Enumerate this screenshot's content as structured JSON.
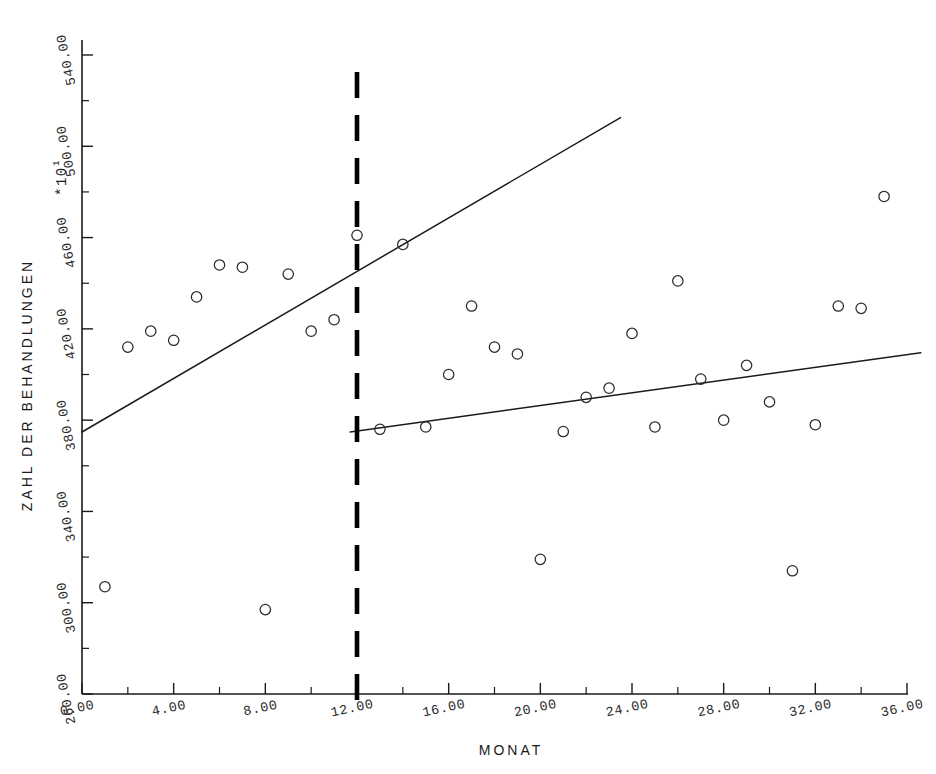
{
  "chart_data": {
    "type": "scatter",
    "title": "",
    "xlabel": "MONAT",
    "ylabel": "ZAHL DER BEHANDLUNGEN",
    "y_exponent_label": "*10",
    "y_exponent_sup": "1",
    "xlim": [
      0,
      36
    ],
    "ylim": [
      260,
      540
    ],
    "grid": false,
    "legend": "none",
    "x_ticks_labeled": [
      "0.00",
      "4.00",
      "8.00",
      "12.00",
      "16.00",
      "20.00",
      "24.00",
      "28.00",
      "32.00",
      "36.00"
    ],
    "x_tick_values": [
      0,
      4,
      8,
      12,
      16,
      20,
      24,
      28,
      32,
      36
    ],
    "x_minor_tick_values": [
      2,
      6,
      10,
      14,
      18,
      22,
      26,
      30,
      34
    ],
    "y_ticks_labeled": [
      "260.00",
      "300.00",
      "340.00",
      "380.00",
      "420.00",
      "460.00",
      "500.00",
      "540.00"
    ],
    "y_tick_values": [
      260,
      300,
      340,
      380,
      420,
      460,
      500,
      540
    ],
    "y_minor_tick_values": [
      280,
      320,
      360,
      400,
      440,
      480,
      520
    ],
    "marker": "open-circle",
    "series": [
      {
        "name": "Beobachtungen",
        "x": [
          1,
          2,
          3,
          4,
          5,
          6,
          7,
          8,
          9,
          10,
          11,
          12,
          13,
          14,
          15,
          16,
          17,
          18,
          19,
          20,
          21,
          22,
          23,
          24,
          25,
          26,
          27,
          28,
          29,
          30,
          31,
          32,
          33,
          34,
          35
        ],
        "y": [
          307,
          412,
          419,
          415,
          434,
          448,
          447,
          297,
          444,
          419,
          424,
          461,
          376,
          457,
          377,
          400,
          430,
          412,
          409,
          319,
          375,
          390,
          394,
          418,
          377,
          441,
          398,
          380,
          404,
          388,
          314,
          378,
          430,
          429,
          478
        ]
      }
    ],
    "annotations": [
      {
        "name": "intervention-line",
        "kind": "vertical-dashed-line",
        "x": 12,
        "style": "thick black dashed"
      },
      {
        "name": "pre-regression-line",
        "kind": "line-segment",
        "x0": 0,
        "y0": 374.8,
        "x1": 23.5,
        "y1": 512.6
      },
      {
        "name": "post-regression-line",
        "kind": "line-segment",
        "x0": 11.7,
        "y0": 374.8,
        "x1": 36.6,
        "y1": 409.5
      }
    ]
  },
  "axes": {
    "x_title": "MONAT",
    "y_title": "ZAHL DER BEHANDLUNGEN",
    "y_exponent": "*10",
    "y_exponent_sup": "1"
  }
}
